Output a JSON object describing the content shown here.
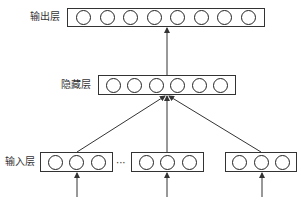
{
  "diagram": {
    "type": "neural-network-layers",
    "layers": {
      "output": {
        "label": "输出层",
        "node_count": 8
      },
      "hidden": {
        "label": "隐藏层",
        "node_count": 6
      },
      "input": {
        "label": "输入层",
        "groups": [
          {
            "node_count": 3
          },
          {
            "node_count": 3
          },
          {
            "node_count": 3
          }
        ],
        "separator": "···"
      }
    },
    "edges": [
      {
        "from": "input.group.0",
        "to": "hidden"
      },
      {
        "from": "input.group.1",
        "to": "hidden"
      },
      {
        "from": "input.group.2",
        "to": "hidden"
      },
      {
        "from": "hidden",
        "to": "output"
      }
    ],
    "external_inputs": 3,
    "colors": {
      "stroke": "#333333",
      "background": "#ffffff"
    }
  }
}
